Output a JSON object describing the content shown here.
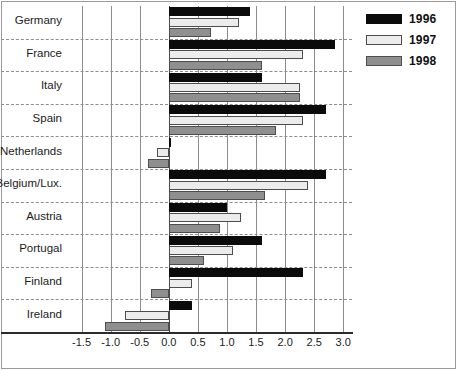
{
  "chart_data": {
    "type": "bar",
    "orientation": "horizontal",
    "title": "",
    "subtitle": "",
    "xlabel": "",
    "ylabel": "",
    "xlim": [
      -1.75,
      3.15
    ],
    "xticks": [
      -1.5,
      -1.0,
      -0.5,
      0.0,
      0.5,
      1.0,
      1.5,
      2.0,
      2.5,
      3.0
    ],
    "xtick_labels": [
      "-1.5",
      "-1.0",
      "-0.5",
      "0.0",
      "0.5",
      "1.0",
      "1.5",
      "2.0",
      "2.5",
      "3.0"
    ],
    "grid": "vertical solid gridlines at each x tick; horizontal dashed separators between country groups",
    "legend_position": "top-right",
    "categories": [
      "Germany",
      "France",
      "Italy",
      "Spain",
      "Netherlands",
      "Belgium/Lux.",
      "Austria",
      "Portugal",
      "Finland",
      "Ireland"
    ],
    "series": [
      {
        "name": "1996",
        "color": "#0b0b0b",
        "values": [
          1.4,
          2.85,
          1.6,
          2.7,
          0.02,
          2.7,
          1.0,
          1.6,
          2.3,
          0.4
        ]
      },
      {
        "name": "1997",
        "color": "#ececec",
        "values": [
          1.2,
          2.3,
          2.25,
          2.3,
          -0.2,
          2.4,
          1.25,
          1.1,
          0.4,
          -0.75
        ]
      },
      {
        "name": "1998",
        "color": "#8f8f8f",
        "values": [
          0.73,
          1.6,
          2.25,
          1.85,
          -0.35,
          1.65,
          0.88,
          0.6,
          -0.3,
          -1.1
        ]
      }
    ]
  },
  "legend": {
    "entries": [
      {
        "label": "1996",
        "swatch": "black-solid"
      },
      {
        "label": "1997",
        "swatch": "white-outline"
      },
      {
        "label": "1998",
        "swatch": "gray-solid"
      }
    ]
  },
  "colors": {
    "series_1996": "#0b0b0b",
    "series_1997": "#ececec",
    "series_1998": "#8f8f8f",
    "grid": "#8d8d8d",
    "axis": "#2b2b2b",
    "text": "#1c1c1c",
    "background": "#ffffff"
  }
}
